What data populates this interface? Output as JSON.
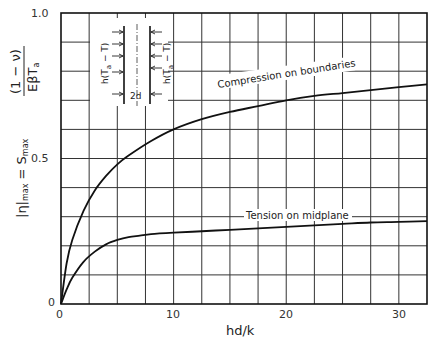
{
  "chart_data": {
    "type": "line",
    "title": "",
    "xlabel": "hd/k",
    "ylabel": "|η|max = Smax (1 − ν) / (E β Ta)",
    "xlim": [
      0,
      32.5
    ],
    "ylim": [
      0,
      1.0
    ],
    "grid": true,
    "x_ticks": [
      "0",
      "10",
      "20",
      "30"
    ],
    "y_ticks": [
      "0",
      "0.5",
      "1.0"
    ],
    "x_grid_step": 2.5,
    "y_grid_step": 0.1,
    "series": [
      {
        "name": "Compression on boundaries",
        "x": [
          0,
          0.5,
          1,
          2,
          3,
          4,
          5,
          6,
          8,
          10,
          12.5,
          15,
          17.5,
          20,
          22.5,
          25,
          27.5,
          30,
          32.5
        ],
        "y": [
          0,
          0.14,
          0.22,
          0.32,
          0.39,
          0.44,
          0.48,
          0.51,
          0.56,
          0.6,
          0.635,
          0.66,
          0.68,
          0.7,
          0.715,
          0.725,
          0.735,
          0.745,
          0.755
        ]
      },
      {
        "name": "Tension on midplane",
        "x": [
          0,
          0.5,
          1,
          2,
          3,
          4,
          5,
          6,
          7,
          8,
          10,
          12.5,
          15,
          17.5,
          20,
          22.5,
          25,
          27.5,
          30,
          32.5
        ],
        "y": [
          0,
          0.05,
          0.09,
          0.145,
          0.18,
          0.205,
          0.22,
          0.23,
          0.235,
          0.24,
          0.245,
          0.25,
          0.255,
          0.26,
          0.265,
          0.27,
          0.275,
          0.28,
          0.282,
          0.285
        ]
      }
    ],
    "annotations": [
      "Compression on boundaries",
      "Tension on midplane"
    ],
    "inset_diagram": {
      "left_label": "h(Ta − T)",
      "right_label": "h(Ta − T)",
      "center_label": "2d"
    }
  },
  "labels": {
    "xlabel": "hd/k",
    "ylabel_left": "|η|",
    "ylabel_max": "max",
    "ylabel_eq": " = S",
    "ylabel_smax_sub": "max",
    "ylabel_num": "(1 − ν)",
    "ylabel_den": "EβT",
    "ylabel_den_sub": "a",
    "origin_y": "0",
    "origin_x": "0",
    "curve1": "Compression on boundaries",
    "curve2": "Tension on midplane",
    "inset_left": "h(T",
    "inset_sub": "a",
    "inset_rest": " − T)",
    "inset_center": "2d"
  }
}
